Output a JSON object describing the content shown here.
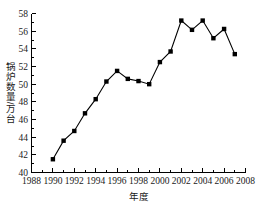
{
  "chart_data": {
    "type": "line",
    "title": "",
    "xlabel": "年度",
    "ylabel": "锅炉数量/万台",
    "xlim": [
      1988,
      2008
    ],
    "ylim": [
      40,
      58
    ],
    "grid": false,
    "legend": null,
    "x_ticks": [
      "1988",
      "1990",
      "1992",
      "1994",
      "1996",
      "1998",
      "2000",
      "2002",
      "2004",
      "2006",
      "2008"
    ],
    "x_tick_values": [
      1988,
      1990,
      1992,
      1994,
      1996,
      1998,
      2000,
      2002,
      2004,
      2006,
      2008
    ],
    "x_minor_step": 1,
    "y_ticks": [
      "40",
      "42",
      "44",
      "46",
      "48",
      "50",
      "52",
      "54",
      "56",
      "58"
    ],
    "y_tick_values": [
      40,
      42,
      44,
      46,
      48,
      50,
      52,
      54,
      56,
      58
    ],
    "y_minor_step": 1,
    "marker": "square",
    "marker_color": "#000000",
    "line_color": "#000000",
    "x": [
      1990,
      1991,
      1992,
      1993,
      1994,
      1995,
      1996,
      1997,
      1998,
      1999,
      2000,
      2001,
      2002,
      2003,
      2004,
      2005,
      2006,
      2007
    ],
    "values": [
      41.5,
      43.6,
      44.7,
      46.7,
      48.3,
      50.3,
      51.5,
      50.6,
      50.35,
      50.0,
      52.5,
      53.7,
      57.2,
      56.15,
      57.2,
      55.2,
      56.25,
      53.4
    ],
    "series": [
      {
        "name": "锅炉数量",
        "values": [
          41.5,
          43.6,
          44.7,
          46.7,
          48.3,
          50.3,
          51.5,
          50.6,
          50.35,
          50.0,
          52.5,
          53.7,
          57.2,
          56.15,
          57.2,
          55.2,
          56.25,
          53.4
        ]
      }
    ]
  }
}
